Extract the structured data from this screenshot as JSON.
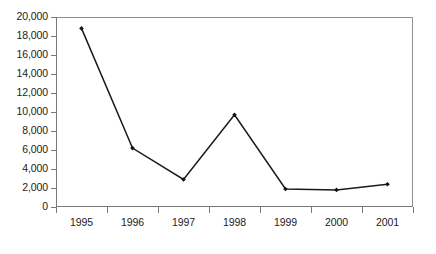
{
  "chart_data": {
    "type": "line",
    "title": "",
    "subtitle": "",
    "xlabel": "",
    "ylabel": "",
    "categories": [
      "1995",
      "1996",
      "1997",
      "1998",
      "1999",
      "2000",
      "2001"
    ],
    "values": [
      18800,
      6200,
      2900,
      9700,
      1900,
      1800,
      2400
    ],
    "series": [
      {
        "name": "",
        "values": [
          18800,
          6200,
          2900,
          9700,
          1900,
          1800,
          2400
        ]
      }
    ],
    "ylim": [
      0,
      20000
    ],
    "ytick_values": [
      0,
      2000,
      4000,
      6000,
      8000,
      10000,
      12000,
      14000,
      16000,
      18000,
      20000
    ],
    "ytick_labels": [
      "0",
      "2,000",
      "4,000",
      "6,000",
      "8,000",
      "10,000",
      "12,000",
      "14,000",
      "16,000",
      "18,000",
      "20,000"
    ],
    "xtick_labels": [
      "1995",
      "1996",
      "1997",
      "1998",
      "1999",
      "2000",
      "2001"
    ],
    "grid": false,
    "legend": false,
    "legend_position": "none",
    "marker": "filled-diamond",
    "line_color": "#1a1a1a",
    "marker_color": "#141414",
    "axis_color": "#77797b",
    "background_color": "#ffffff",
    "annotations": []
  },
  "page_bleed": {
    "text": ""
  }
}
